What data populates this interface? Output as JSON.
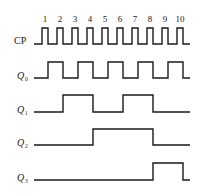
{
  "diagram": {
    "title": "",
    "type": "timing-diagram",
    "clock_numbers": [
      "1",
      "2",
      "3",
      "4",
      "5",
      "6",
      "7",
      "8",
      "9",
      "10"
    ],
    "signals": [
      {
        "name": "CP",
        "label_main": "CP",
        "label_sub": "",
        "italic": false,
        "label_y": 44,
        "high_y": 28,
        "low_y": 44,
        "points": "34,44 42,44 42,28 48,28 48,44 57,44 57,28 63,28 63,44 72,44 72,28 78,28 78,44 87,44 87,28 93,28 93,44 102,44 102,28 108,28 108,44 117,44 117,28 123,28 123,44 132,44 132,28 138,28 138,44 147,44 147,28 153,28 153,44 162,44 162,28 168,28 168,44 177,44 177,28 183,28 183,44 190,44"
      },
      {
        "name": "Q0",
        "label_main": "Q",
        "label_sub": "0",
        "italic": true,
        "label_y": 79,
        "high_y": 62,
        "low_y": 78,
        "points": "34,78 48,78 48,62 63,62 63,78 78,78 78,62 93,62 93,78 108,78 108,62 123,62 123,78 138,78 138,62 153,62 153,78 168,78 168,62 183,62 183,78 190,78"
      },
      {
        "name": "Q1",
        "label_main": "Q",
        "label_sub": "1",
        "italic": true,
        "label_y": 113,
        "high_y": 95,
        "low_y": 112,
        "points": "34,112 63,112 63,95 93,95 93,112 123,112 123,95 153,95 153,112 190,112"
      },
      {
        "name": "Q2",
        "label_main": "Q",
        "label_sub": "2",
        "italic": true,
        "label_y": 146,
        "high_y": 129,
        "low_y": 145,
        "points": "34,145 93,145 93,129 153,129 153,145 190,145"
      },
      {
        "name": "Q3",
        "label_main": "Q",
        "label_sub": "3",
        "italic": true,
        "label_y": 181,
        "high_y": 163,
        "low_y": 180,
        "points": "34,180 153,180 153,163 183,163 183,180 190,180"
      }
    ],
    "tick_x": [
      45,
      60,
      75,
      90,
      105,
      120,
      135,
      150,
      165,
      180
    ],
    "tick_y": 22
  }
}
